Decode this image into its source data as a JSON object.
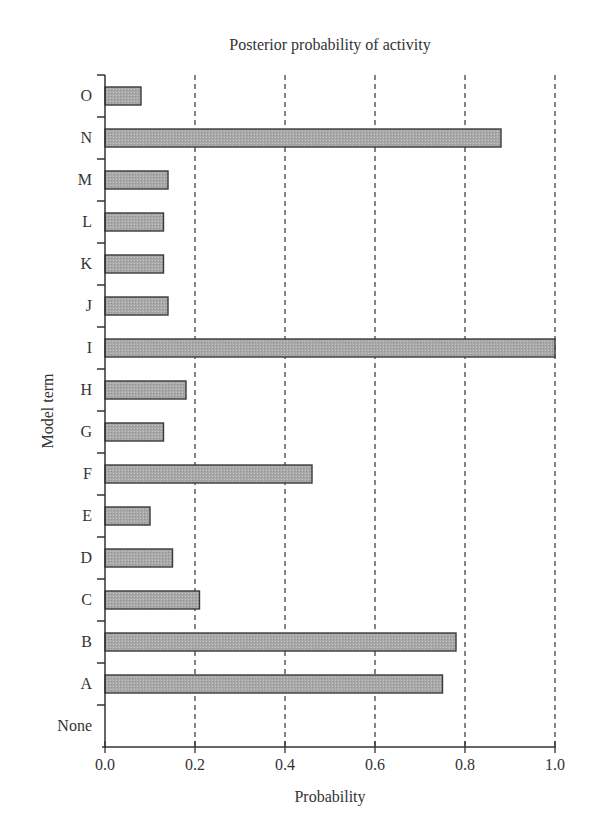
{
  "chart_data": {
    "type": "bar",
    "orientation": "horizontal",
    "title": "Posterior probability of activity",
    "xlabel": "Probability",
    "ylabel": "Model term",
    "xlim": [
      0.0,
      1.0
    ],
    "xticks": [
      "0.0",
      "0.2",
      "0.4",
      "0.6",
      "0.8",
      "1.0"
    ],
    "grid": "vertical dashed at 0.2, 0.4, 0.6, 0.8, 1.0",
    "categories": [
      "O",
      "N",
      "M",
      "L",
      "K",
      "J",
      "I",
      "H",
      "G",
      "F",
      "E",
      "D",
      "C",
      "B",
      "A",
      "None"
    ],
    "values": [
      0.08,
      0.88,
      0.14,
      0.13,
      0.13,
      0.14,
      1.0,
      0.18,
      0.13,
      0.46,
      0.1,
      0.15,
      0.21,
      0.78,
      0.75,
      0.0
    ],
    "bar_color": "#a9a9a9",
    "bar_edge_color": "#3a3a3a"
  }
}
